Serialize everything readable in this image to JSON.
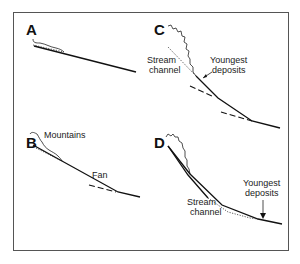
{
  "diagram": {
    "panels": [
      {
        "id": "A",
        "letter": "A",
        "labels": []
      },
      {
        "id": "B",
        "letter": "B",
        "labels": [
          "Mountains",
          "Fan"
        ]
      },
      {
        "id": "C",
        "letter": "C",
        "labels": [
          "Stream",
          "channel",
          "Youngest",
          "deposits"
        ]
      },
      {
        "id": "D",
        "letter": "D",
        "labels": [
          "Youngest",
          "deposits",
          "Stream",
          "channel"
        ]
      }
    ],
    "colors": {
      "ink": "#111111",
      "frame": "#555555",
      "background": "#ffffff"
    }
  }
}
